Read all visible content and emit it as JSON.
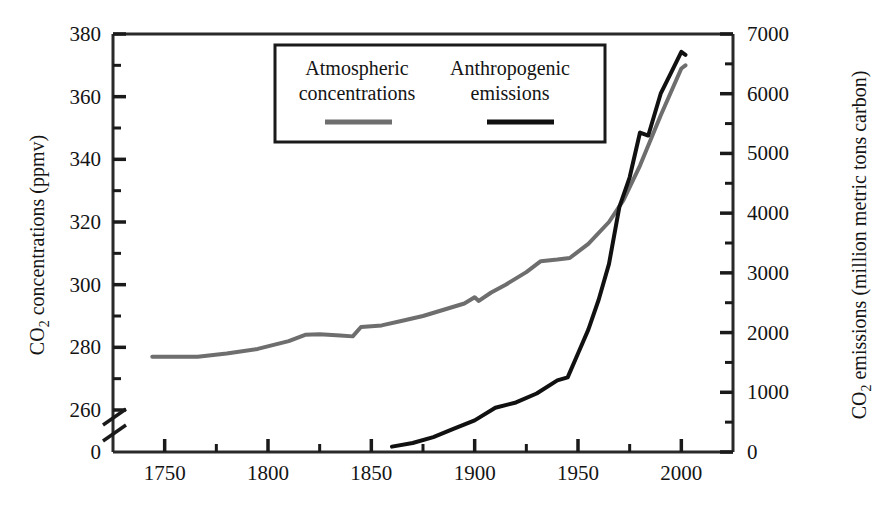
{
  "chart_data": {
    "type": "line",
    "title": "",
    "xlabel": "",
    "xlim": [
      1725,
      2025
    ],
    "x_ticks": [
      1750,
      1800,
      1850,
      1900,
      1950,
      2000
    ],
    "x_minor_ticks": [
      1725,
      1775,
      1825,
      1875,
      1925,
      1975,
      2025
    ],
    "grid": false,
    "legend_position": "top-center",
    "axes": {
      "left": {
        "label": "CO2 concentrations (ppmv)",
        "label_prefix": "CO",
        "label_sub": "2",
        "label_suffix": " concentrations (ppmv)",
        "ticks": [
          260,
          280,
          300,
          320,
          340,
          360,
          380
        ],
        "minor_ticks": [
          270,
          290,
          310,
          330,
          350,
          370
        ],
        "broken_axis_base_tick": 0,
        "ylim": [
          260,
          380
        ],
        "axis_break": true
      },
      "right": {
        "label": "CO2 emissions (million metric tons carbon)",
        "label_prefix": "CO",
        "label_sub": "2",
        "label_suffix": " emissions (million metric tons carbon)",
        "ticks": [
          0,
          1000,
          2000,
          3000,
          4000,
          5000,
          6000,
          7000
        ],
        "minor_ticks": [
          500,
          1500,
          2500,
          3500,
          4500,
          5500,
          6500
        ],
        "ylim": [
          0,
          7000
        ]
      }
    },
    "series": [
      {
        "name": "Atmospheric concentrations",
        "legend_label_line1": "Atmospheric",
        "legend_label_line2": "concentrations",
        "color": "#6e6e6e",
        "axis": "left",
        "unit": "ppmv",
        "points": [
          [
            1744,
            277.0
          ],
          [
            1757,
            277.0
          ],
          [
            1766,
            277.0
          ],
          [
            1780,
            278.0
          ],
          [
            1795,
            279.5
          ],
          [
            1810,
            282.0
          ],
          [
            1818,
            284.0
          ],
          [
            1825,
            284.2
          ],
          [
            1835,
            283.8
          ],
          [
            1841,
            283.5
          ],
          [
            1845,
            286.5
          ],
          [
            1855,
            287.0
          ],
          [
            1865,
            288.5
          ],
          [
            1875,
            290.0
          ],
          [
            1885,
            292.0
          ],
          [
            1895,
            294.0
          ],
          [
            1900,
            296.0
          ],
          [
            1902,
            294.8
          ],
          [
            1908,
            297.5
          ],
          [
            1915,
            300.0
          ],
          [
            1925,
            304.0
          ],
          [
            1932,
            307.5
          ],
          [
            1940,
            308.0
          ],
          [
            1946,
            308.5
          ],
          [
            1955,
            313.0
          ],
          [
            1965,
            320.0
          ],
          [
            1972,
            327.0
          ],
          [
            1980,
            338.0
          ],
          [
            1990,
            354.0
          ],
          [
            2000,
            369.0
          ],
          [
            2002,
            370.0
          ]
        ]
      },
      {
        "name": "Anthropogenic emissions",
        "legend_label_line1": "Anthropogenic",
        "legend_label_line2": "emissions",
        "color": "#111111",
        "axis": "right",
        "unit": "million metric tons carbon",
        "points": [
          [
            1860,
            90
          ],
          [
            1870,
            150
          ],
          [
            1880,
            250
          ],
          [
            1890,
            390
          ],
          [
            1900,
            530
          ],
          [
            1910,
            740
          ],
          [
            1920,
            830
          ],
          [
            1930,
            980
          ],
          [
            1940,
            1200
          ],
          [
            1945,
            1250
          ],
          [
            1950,
            1650
          ],
          [
            1955,
            2050
          ],
          [
            1960,
            2550
          ],
          [
            1965,
            3150
          ],
          [
            1970,
            4100
          ],
          [
            1975,
            4600
          ],
          [
            1980,
            5350
          ],
          [
            1984,
            5300
          ],
          [
            1990,
            6000
          ],
          [
            1995,
            6350
          ],
          [
            2000,
            6700
          ],
          [
            2002,
            6650
          ]
        ]
      }
    ]
  },
  "legend": {
    "entries": [
      {
        "line1": "Atmospheric",
        "line2": "concentrations",
        "color": "#6e6e6e"
      },
      {
        "line1": "Anthropogenic",
        "line2": "emissions",
        "color": "#111111"
      }
    ]
  },
  "axis_tick_text": {
    "left": [
      "380",
      "360",
      "340",
      "320",
      "300",
      "280",
      "260",
      "0"
    ],
    "right": [
      "7000",
      "6000",
      "5000",
      "4000",
      "3000",
      "2000",
      "1000",
      "0"
    ],
    "bottom": [
      "1750",
      "1800",
      "1850",
      "1900",
      "1950",
      "2000"
    ]
  }
}
